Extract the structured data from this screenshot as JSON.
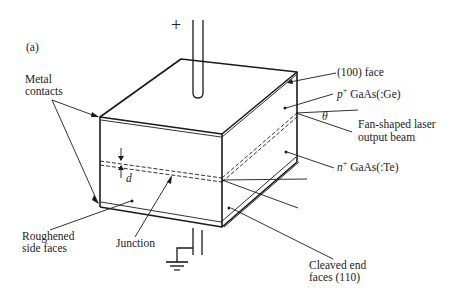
{
  "figure": {
    "panel_label": "(a)",
    "terminal_plus": "+",
    "labels": {
      "metal_contacts_line1": "Metal",
      "metal_contacts_line2": "contacts",
      "face_100": "(100) face",
      "p_layer_sup": "+",
      "p_layer_var": "p",
      "p_layer_rest": " GaAs(:Ge)",
      "theta": "θ",
      "beam_line1": "Fan-shaped laser",
      "beam_line2": "output beam",
      "n_layer_var": "n",
      "n_layer_sup": "+",
      "n_layer_rest": " GaAs(:Te)",
      "d": "d",
      "roughened_line1": "Roughened",
      "roughened_line2": "side faces",
      "junction": "Junction",
      "cleaved_line1": "Cleaved end",
      "cleaved_line2": "faces (110)"
    },
    "colors": {
      "ink": "#1a1a1a",
      "text": "#222222",
      "background": "#ffffff"
    }
  }
}
